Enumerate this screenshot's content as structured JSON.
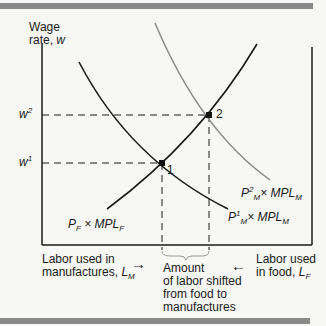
{
  "axes": {
    "y_label_line1": "Wage",
    "y_label_line2": "rate, ",
    "y_label_var": "w",
    "x_left_label_line1": "Labor used in",
    "x_left_label_line2": "manufactures, ",
    "x_left_var": "L",
    "x_left_sub": "M",
    "x_right_label_line1": "Labor used",
    "x_right_label_line2": "in food, ",
    "x_right_var": "L",
    "x_right_sub": "F",
    "arrow_right": "→",
    "arrow_left": "←"
  },
  "wage_levels": [
    {
      "label": "w",
      "sup": "2"
    },
    {
      "label": "w",
      "sup": "1"
    }
  ],
  "points": [
    {
      "label": "1"
    },
    {
      "label": "2"
    }
  ],
  "curves": {
    "food": {
      "p": "P",
      "p_sub": "F",
      "times": " × ",
      "mpl": "MPL",
      "mpl_sub": "F"
    },
    "manuf1": {
      "p": "P",
      "p_sub": "M",
      "p_sup": "1",
      "times": "× ",
      "mpl": "MPL",
      "mpl_sub": "M"
    },
    "manuf2": {
      "p": "P",
      "p_sub": "M",
      "p_sup": "2",
      "times": "× ",
      "mpl": "MPL",
      "mpl_sub": "M"
    }
  },
  "brace_caption": [
    "Amount",
    "of labor shifted",
    "from food to",
    "manufactures"
  ],
  "colors": {
    "black_curve": "#1a1a1a",
    "gray_curve": "#8a8a8a",
    "bars": "#8a8a8a"
  }
}
